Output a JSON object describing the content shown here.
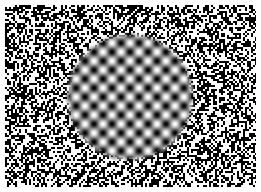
{
  "image": {
    "title": "Gabor plaid patch embedded in binary visual noise",
    "kind": "psychophysics-stimulus",
    "width": 261,
    "height": 192,
    "page_background": "#ffffff",
    "alt_text": "A grayscale square field of dense random black-and-white pixel noise with a large circular patch in the middle showing a smooth checkerboard-like grid of blurred dark blobs and bright spots."
  },
  "margin": {
    "label": "white page margin",
    "left": 5,
    "top": 5,
    "right": 5,
    "bottom": 5,
    "color": "#ffffff"
  },
  "noise_field": {
    "label": "binary random noise background",
    "x": 5,
    "y": 5,
    "width": 251,
    "height": 182,
    "grain_px": 2,
    "black": "#000000",
    "white": "#ffffff",
    "white_fraction": 0.5,
    "seed": 20250214
  },
  "patch": {
    "label": "circular plaid grating patch",
    "shape": "circle",
    "center_x": 130,
    "center_y": 97,
    "diameter": 125,
    "radius": 62.5,
    "edge_feather_px": 3
  },
  "grating": {
    "label": "two-dimensional plaid sinusoid",
    "type": "plaid",
    "period_px": 18,
    "orientation_deg": [
      0,
      90
    ],
    "phase_deg": 0,
    "center_luminance": "bright",
    "min_gray": "#000000",
    "max_gray": "#ffffff",
    "mean_gray": "#808080",
    "contrast": 1.0,
    "gamma": 0.9
  },
  "chart_data": {
    "type": "heatmap",
    "xlabel": "",
    "ylabel": "",
    "colormap": "grayscale",
    "vmin": 0,
    "vmax": 255,
    "grid": false,
    "legend": "none",
    "regions": [
      {
        "name": "noise-background",
        "description": "uniform random binary black/white pixel noise",
        "bounds_px": [
          5,
          5,
          256,
          187
        ],
        "distribution": "bernoulli",
        "p_white": 0.5,
        "grain_px": 2
      },
      {
        "name": "plaid-patch",
        "description": "product of two orthogonal sinusoids inside a circular aperture",
        "center_px": [
          130,
          97
        ],
        "radius_px": 62.5,
        "period_px": 18,
        "formula": "L = 128 + 127*cos(2*pi*x/18)*cos(2*pi*y/18)",
        "peak_luminance": 255,
        "trough_luminance": 0,
        "blob_rows": 7,
        "blob_cols": 7
      }
    ]
  }
}
